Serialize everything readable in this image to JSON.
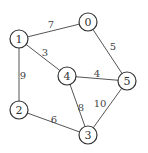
{
  "graph": {
    "nodes": [
      {
        "id": "0",
        "label": "0",
        "x": 88,
        "y": 22
      },
      {
        "id": "1",
        "label": "1",
        "x": 19,
        "y": 39
      },
      {
        "id": "2",
        "label": "2",
        "x": 19,
        "y": 110
      },
      {
        "id": "3",
        "label": "3",
        "x": 88,
        "y": 135
      },
      {
        "id": "4",
        "label": "4",
        "x": 67,
        "y": 76
      },
      {
        "id": "5",
        "label": "5",
        "x": 127,
        "y": 81
      }
    ],
    "edges": [
      {
        "from": "1",
        "to": "0",
        "weight": "7",
        "lx": 51,
        "ly": 24
      },
      {
        "from": "0",
        "to": "5",
        "weight": "5",
        "lx": 113,
        "ly": 46
      },
      {
        "from": "1",
        "to": "4",
        "weight": "3",
        "lx": 45,
        "ly": 52
      },
      {
        "from": "4",
        "to": "5",
        "weight": "4",
        "lx": 97,
        "ly": 73
      },
      {
        "from": "1",
        "to": "2",
        "weight": "9",
        "lx": 23,
        "ly": 75
      },
      {
        "from": "4",
        "to": "3",
        "weight": "8",
        "lx": 81,
        "ly": 107
      },
      {
        "from": "5",
        "to": "3",
        "weight": "10",
        "lx": 100,
        "ly": 103
      },
      {
        "from": "2",
        "to": "3",
        "weight": "6",
        "lx": 54,
        "ly": 119
      }
    ]
  }
}
